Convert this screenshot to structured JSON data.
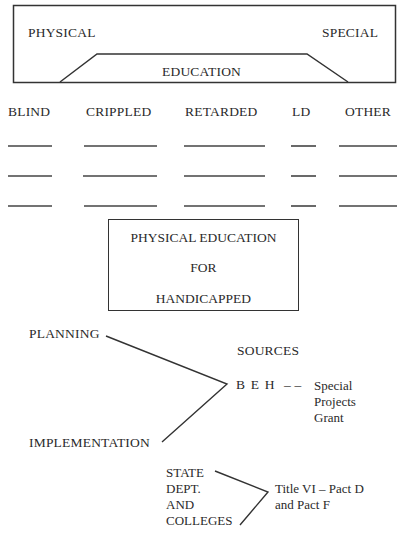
{
  "top_box": {
    "left_label": "PHYSICAL",
    "right_label": "SPECIAL",
    "center_label": "EDUCATION"
  },
  "categories": {
    "columns": [
      {
        "label": "BLIND",
        "blanks": 3
      },
      {
        "label": "CRIPPLED",
        "blanks": 3
      },
      {
        "label": "RETARDED",
        "blanks": 3
      },
      {
        "label": "LD",
        "blanks": 3
      },
      {
        "label": "OTHER",
        "blanks": 3
      }
    ]
  },
  "center_box": {
    "line1": "PHYSICAL EDUCATION",
    "line2": "FOR",
    "line3": "HANDICAPPED"
  },
  "funding": {
    "planning": "PLANNING",
    "implementation": "IMPLEMENTATION",
    "sources_heading": "SOURCES",
    "beh": "B E H",
    "dash": "– –",
    "beh_program": [
      "Special",
      "Projects",
      "Grant"
    ]
  },
  "state": {
    "lines": [
      "STATE",
      "DEPT.",
      "AND",
      "COLLEGES"
    ],
    "program": [
      "Title VI – Pact D",
      "and Pact F"
    ]
  }
}
